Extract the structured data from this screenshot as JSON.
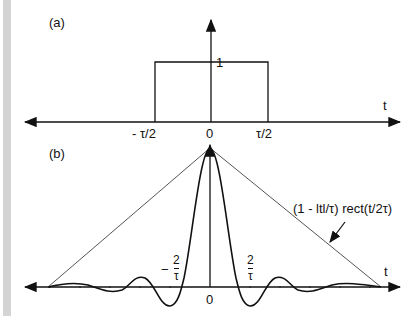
{
  "panel_a": {
    "label": "(a)",
    "height_label": "1",
    "t_axis_label": "t",
    "tick_left": "- τ/2",
    "tick_zero": "0",
    "tick_right": "τ/2"
  },
  "panel_b": {
    "label": "(b)",
    "t_axis_label": "t",
    "tick_zero": "0",
    "neg_tick_prefix": "−",
    "frac_num": "2",
    "frac_den": "τ",
    "envelope_label": "(1 - ltl/τ) rect(t/2τ)"
  },
  "colors": {
    "line": "#111111",
    "envelope": "#555555",
    "sidebar": "#d4d4d4"
  }
}
